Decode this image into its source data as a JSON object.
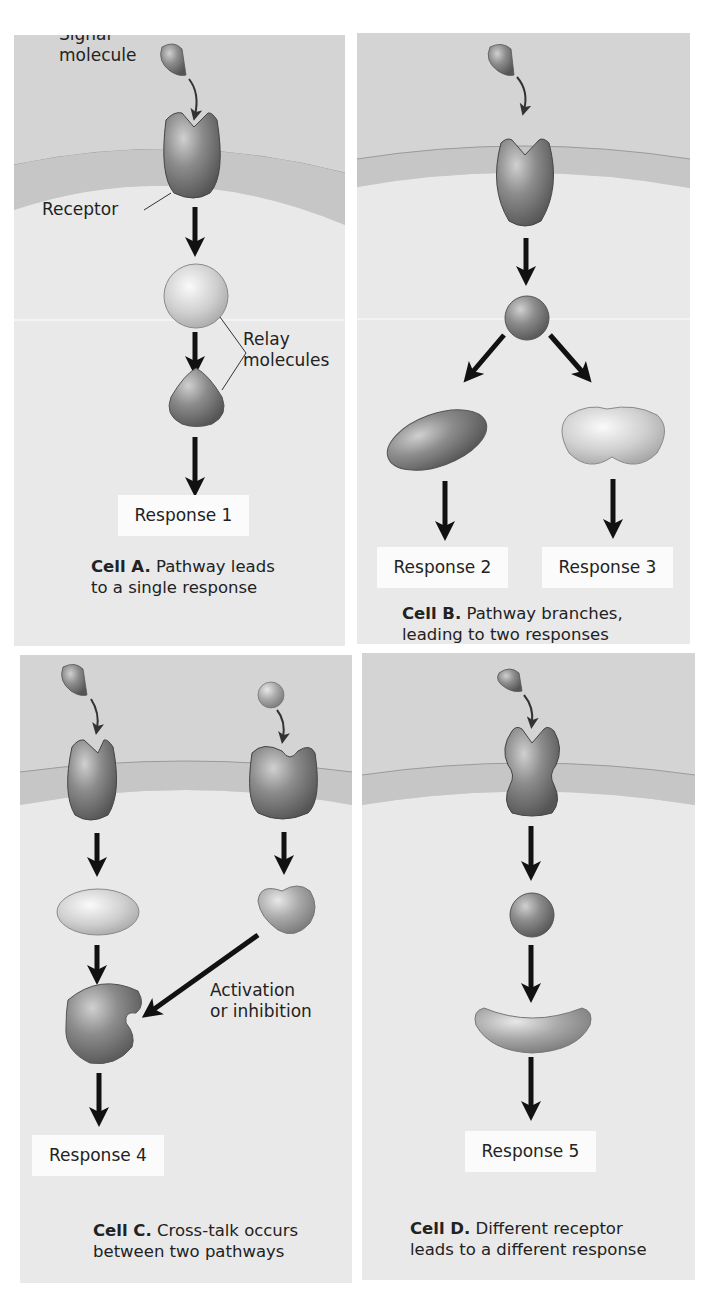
{
  "figure": {
    "panels": [
      {
        "id": "A",
        "labels": {
          "signal": "Signal\nmolecule",
          "signal_line1": "Signal",
          "signal_line2": "molecule",
          "receptor": "Receptor",
          "relay_line1": "Relay",
          "relay_line2": "molecules"
        },
        "responses": [
          "Response 1"
        ],
        "caption": {
          "bold": "Cell A.",
          "line1_rest": " Pathway leads",
          "line2": "to a single response"
        }
      },
      {
        "id": "B",
        "responses": [
          "Response 2",
          "Response 3"
        ],
        "caption": {
          "bold": "Cell B.",
          "line1_rest": " Pathway branches,",
          "line2": "leading to two responses"
        }
      },
      {
        "id": "C",
        "labels": {
          "crosstalk_line1": "Activation",
          "crosstalk_line2": "or inhibition"
        },
        "responses": [
          "Response 4"
        ],
        "caption": {
          "bold": "Cell C.",
          "line1_rest": " Cross-talk occurs",
          "line2": "between two pathways"
        }
      },
      {
        "id": "D",
        "responses": [
          "Response 5"
        ],
        "caption": {
          "bold": "Cell D.",
          "line1_rest": " Different receptor",
          "line2": "leads to a different response"
        }
      }
    ],
    "colors": {
      "extracellular": "#d4d4d4",
      "membrane": "#c6c6c6",
      "cytoplasm": "#e9e9e9",
      "molecule_dark": "#7b7b7b",
      "molecule_light": "#c8c8c8",
      "arrow": "#111111",
      "response_box": "#fbfbfb"
    }
  }
}
